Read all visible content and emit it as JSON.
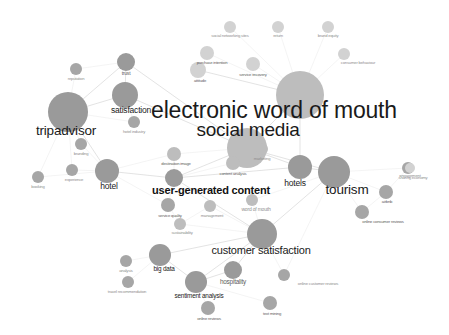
{
  "figure": {
    "type": "network-graph",
    "style": "keyword co-occurrence map",
    "background_color": "#ffffff",
    "node_color": "#9a9a9a",
    "edge_color": "#d9d9d9",
    "label_color": "#1a1a1a"
  },
  "nodes": [
    {
      "id": "electronic-word-of-mouth",
      "label": "electronic word of mouth",
      "x": 274,
      "y": 110,
      "r": 24,
      "size_class": "mega",
      "tone": "node-light",
      "cx": 300,
      "cy": 95
    },
    {
      "id": "social-media",
      "label": "social media",
      "x": 248,
      "y": 130,
      "r": 20,
      "size_class": "huge",
      "tone": "node-light",
      "cx": 247,
      "cy": 148
    },
    {
      "id": "tripadvisor",
      "label": "tripadvisor",
      "x": 66,
      "y": 130,
      "r": 20,
      "size_class": "xxl",
      "tone": "node",
      "cx": 68,
      "cy": 112
    },
    {
      "id": "tourism",
      "label": "tourism",
      "x": 347,
      "y": 189,
      "r": 16,
      "size_class": "xxl",
      "tone": "node",
      "cx": 334,
      "cy": 172
    },
    {
      "id": "user-generated-content",
      "label": "user-generated content",
      "x": 211,
      "y": 190,
      "r": 9,
      "size_class": "xl",
      "tone": "node",
      "cx": 174,
      "cy": 178,
      "bold": true
    },
    {
      "id": "customer-satisfaction",
      "label": "customer satisfaction",
      "x": 261,
      "y": 250,
      "r": 15,
      "size_class": "xl",
      "tone": "node",
      "cx": 262,
      "cy": 234
    },
    {
      "id": "satisfaction",
      "label": "satisfaction",
      "x": 131,
      "y": 110,
      "r": 13,
      "size_class": "lg",
      "tone": "node",
      "cx": 125,
      "cy": 95
    },
    {
      "id": "hotels",
      "label": "hotels",
      "x": 295,
      "y": 183,
      "r": 12,
      "size_class": "lg",
      "tone": "node",
      "cx": 300,
      "cy": 167
    },
    {
      "id": "hotel",
      "label": "hotel",
      "x": 109,
      "y": 186,
      "r": 12,
      "size_class": "lg",
      "tone": "node",
      "cx": 107,
      "cy": 171
    },
    {
      "id": "sentiment-analysis",
      "label": "sentiment analysis",
      "x": 199,
      "y": 295,
      "r": 11,
      "size_class": "md",
      "tone": "node",
      "cx": 196,
      "cy": 282
    },
    {
      "id": "big-data",
      "label": "big data",
      "x": 164,
      "y": 268,
      "r": 11,
      "size_class": "md",
      "tone": "node",
      "cx": 160,
      "cy": 255
    },
    {
      "id": "hospitality",
      "label": "hospitality",
      "x": 233,
      "y": 281,
      "r": 9,
      "size_class": "md",
      "tone": "node",
      "cx": 233,
      "cy": 270
    },
    {
      "id": "trust",
      "label": "trust",
      "x": 126,
      "y": 73,
      "r": 9,
      "size_class": "sm",
      "tone": "node",
      "cx": 126,
      "cy": 62
    },
    {
      "id": "reputation",
      "label": "reputation",
      "x": 76,
      "y": 78,
      "r": 6,
      "size_class": "xs",
      "tone": "node-mid",
      "cx": 76,
      "cy": 69
    },
    {
      "id": "hotel-industry",
      "label": "hotel industry",
      "x": 134,
      "y": 131,
      "r": 6,
      "size_class": "xs",
      "tone": "node-mid",
      "cx": 134,
      "cy": 122
    },
    {
      "id": "branding",
      "label": "branding",
      "x": 81,
      "y": 153,
      "r": 6,
      "size_class": "xs",
      "tone": "node-mid",
      "cx": 81,
      "cy": 144
    },
    {
      "id": "booking",
      "label": "booking",
      "x": 38,
      "y": 186,
      "r": 6,
      "size_class": "xs",
      "tone": "node-mid",
      "cx": 38,
      "cy": 177
    },
    {
      "id": "ewom-experience",
      "label": "experience",
      "x": 74,
      "y": 179,
      "r": 6,
      "size_class": "xs",
      "tone": "node-mid",
      "cx": 72,
      "cy": 170
    },
    {
      "id": "destination-image",
      "label": "destination image",
      "x": 176,
      "y": 163,
      "r": 7,
      "size_class": "xs",
      "tone": "node-light",
      "cx": 174,
      "cy": 154
    },
    {
      "id": "content-analysis",
      "label": "content analysis",
      "x": 233,
      "y": 173,
      "r": 7,
      "size_class": "xs",
      "tone": "node-light",
      "cx": 233,
      "cy": 163
    },
    {
      "id": "marketing",
      "label": "marketing",
      "x": 262,
      "y": 158,
      "r": 6,
      "size_class": "xs",
      "tone": "node-light",
      "cx": 262,
      "cy": 149
    },
    {
      "id": "service-quality",
      "label": "service quality",
      "x": 170,
      "y": 215,
      "r": 7,
      "size_class": "xs",
      "tone": "node-mid",
      "cx": 168,
      "cy": 205
    },
    {
      "id": "management",
      "label": "management",
      "x": 212,
      "y": 215,
      "r": 6,
      "size_class": "xs",
      "tone": "node-light",
      "cx": 210,
      "cy": 206
    },
    {
      "id": "word-of-mouth",
      "label": "word of mouth",
      "x": 256,
      "y": 209,
      "r": 6,
      "size_class": "sm",
      "tone": "node-light",
      "cx": 252,
      "cy": 200
    },
    {
      "id": "sustainability",
      "label": "sustainability",
      "x": 182,
      "y": 232,
      "r": 6,
      "size_class": "xs",
      "tone": "node-light",
      "cx": 180,
      "cy": 224
    },
    {
      "id": "online-reviews",
      "label": "online reviews",
      "x": 209,
      "y": 318,
      "r": 7,
      "size_class": "xs",
      "tone": "node-mid",
      "cx": 208,
      "cy": 308
    },
    {
      "id": "text-mining",
      "label": "text mining",
      "x": 272,
      "y": 313,
      "r": 7,
      "size_class": "xs",
      "tone": "node-mid",
      "cx": 270,
      "cy": 303
    },
    {
      "id": "online-customer-reviews",
      "label": "online customer reviews",
      "x": 318,
      "y": 283,
      "r": 6,
      "size_class": "xs",
      "tone": "node-mid",
      "cx": 284,
      "cy": 275
    },
    {
      "id": "analysis",
      "label": "analysis",
      "x": 126,
      "y": 270,
      "r": 6,
      "size_class": "xs",
      "tone": "node-mid",
      "cx": 126,
      "cy": 261
    },
    {
      "id": "travel-recommendation",
      "label": "travel recommendation",
      "x": 127,
      "y": 291,
      "r": 6,
      "size_class": "xs",
      "tone": "node-mid",
      "cx": 128,
      "cy": 282
    },
    {
      "id": "sharing-economy",
      "label": "sharing economy",
      "x": 413,
      "y": 177,
      "r": 6,
      "size_class": "xs",
      "tone": "node-mid",
      "cx": 408,
      "cy": 168
    },
    {
      "id": "airbnb",
      "label": "airbnb",
      "x": 387,
      "y": 201,
      "r": 7,
      "size_class": "xs",
      "tone": "node-mid",
      "cx": 386,
      "cy": 192
    },
    {
      "id": "online-consumer-reviews",
      "label": "online consumer reviews",
      "x": 383,
      "y": 221,
      "r": 7,
      "size_class": "xs",
      "tone": "node-mid",
      "cx": 362,
      "cy": 212
    },
    {
      "id": "social-networking-sites",
      "label": "social networking sites",
      "x": 230,
      "y": 35,
      "r": 6,
      "size_class": "xs",
      "tone": "node-pale",
      "cx": 230,
      "cy": 27
    },
    {
      "id": "return",
      "label": "return",
      "x": 278,
      "y": 35,
      "r": 6,
      "size_class": "xs",
      "tone": "node-pale",
      "cx": 278,
      "cy": 27
    },
    {
      "id": "brand-equity",
      "label": "brand equity",
      "x": 328,
      "y": 35,
      "r": 6,
      "size_class": "xs",
      "tone": "node-pale",
      "cx": 328,
      "cy": 27
    },
    {
      "id": "purchase-intention",
      "label": "purchase intention",
      "x": 212,
      "y": 62,
      "r": 7,
      "size_class": "xs",
      "tone": "node-pale",
      "cx": 207,
      "cy": 53
    },
    {
      "id": "attitude",
      "label": "attitude",
      "x": 200,
      "y": 80,
      "r": 8,
      "size_class": "xs",
      "tone": "node-pale",
      "cx": 198,
      "cy": 70
    },
    {
      "id": "service-recovery",
      "label": "service recovery",
      "x": 253,
      "y": 74,
      "r": 7,
      "size_class": "xs",
      "tone": "node-pale",
      "cx": 253,
      "cy": 64
    },
    {
      "id": "consumer-behaviour",
      "label": "consumer behaviour",
      "x": 358,
      "y": 62,
      "r": 6,
      "size_class": "xs",
      "tone": "node-pale",
      "cx": 344,
      "cy": 54
    },
    {
      "id": "engagement",
      "label": "engagement",
      "x": 410,
      "y": 175,
      "r": 5,
      "size_class": "xs",
      "tone": "node-pale",
      "cx": 410,
      "cy": 168
    }
  ],
  "edges": [
    [
      "tripadvisor",
      "satisfaction"
    ],
    [
      "tripadvisor",
      "trust"
    ],
    [
      "tripadvisor",
      "reputation"
    ],
    [
      "tripadvisor",
      "hotel"
    ],
    [
      "tripadvisor",
      "branding"
    ],
    [
      "tripadvisor",
      "booking"
    ],
    [
      "tripadvisor",
      "hotel-industry"
    ],
    [
      "tripadvisor",
      "ewom-experience"
    ],
    [
      "satisfaction",
      "trust"
    ],
    [
      "satisfaction",
      "hotel-industry"
    ],
    [
      "satisfaction",
      "social-media"
    ],
    [
      "reputation",
      "trust"
    ],
    [
      "trust",
      "social-media"
    ],
    [
      "hotel",
      "booking"
    ],
    [
      "hotel",
      "ewom-experience"
    ],
    [
      "hotel",
      "branding"
    ],
    [
      "hotel",
      "user-generated-content"
    ],
    [
      "hotel",
      "destination-image"
    ],
    [
      "hotel",
      "service-quality"
    ],
    [
      "social-media",
      "electronic-word-of-mouth"
    ],
    [
      "social-media",
      "destination-image"
    ],
    [
      "social-media",
      "content-analysis"
    ],
    [
      "social-media",
      "marketing"
    ],
    [
      "social-media",
      "tourism"
    ],
    [
      "social-media",
      "hotels"
    ],
    [
      "social-media",
      "user-generated-content"
    ],
    [
      "electronic-word-of-mouth",
      "attitude"
    ],
    [
      "electronic-word-of-mouth",
      "purchase-intention"
    ],
    [
      "electronic-word-of-mouth",
      "service-recovery"
    ],
    [
      "electronic-word-of-mouth",
      "social-networking-sites"
    ],
    [
      "electronic-word-of-mouth",
      "return"
    ],
    [
      "electronic-word-of-mouth",
      "brand-equity"
    ],
    [
      "electronic-word-of-mouth",
      "consumer-behaviour"
    ],
    [
      "electronic-word-of-mouth",
      "hotels"
    ],
    [
      "user-generated-content",
      "destination-image"
    ],
    [
      "user-generated-content",
      "content-analysis"
    ],
    [
      "user-generated-content",
      "service-quality"
    ],
    [
      "user-generated-content",
      "hotels"
    ],
    [
      "user-generated-content",
      "customer-satisfaction"
    ],
    [
      "tourism",
      "hotels"
    ],
    [
      "tourism",
      "sharing-economy"
    ],
    [
      "tourism",
      "airbnb"
    ],
    [
      "tourism",
      "online-consumer-reviews"
    ],
    [
      "tourism",
      "customer-satisfaction"
    ],
    [
      "tourism",
      "word-of-mouth"
    ],
    [
      "tourism",
      "online-customer-reviews"
    ],
    [
      "customer-satisfaction",
      "sentiment-analysis"
    ],
    [
      "customer-satisfaction",
      "hospitality"
    ],
    [
      "customer-satisfaction",
      "big-data"
    ],
    [
      "customer-satisfaction",
      "sustainability"
    ],
    [
      "customer-satisfaction",
      "management"
    ],
    [
      "customer-satisfaction",
      "word-of-mouth"
    ],
    [
      "customer-satisfaction",
      "online-customer-reviews"
    ],
    [
      "sentiment-analysis",
      "big-data"
    ],
    [
      "sentiment-analysis",
      "online-reviews"
    ],
    [
      "sentiment-analysis",
      "text-mining"
    ],
    [
      "sentiment-analysis",
      "hospitality"
    ],
    [
      "big-data",
      "analysis"
    ],
    [
      "big-data",
      "travel-recommendation"
    ],
    [
      "airbnb",
      "sharing-economy"
    ],
    [
      "airbnb",
      "online-consumer-reviews"
    ],
    [
      "service-quality",
      "sustainability"
    ],
    [
      "management",
      "sustainability"
    ]
  ]
}
